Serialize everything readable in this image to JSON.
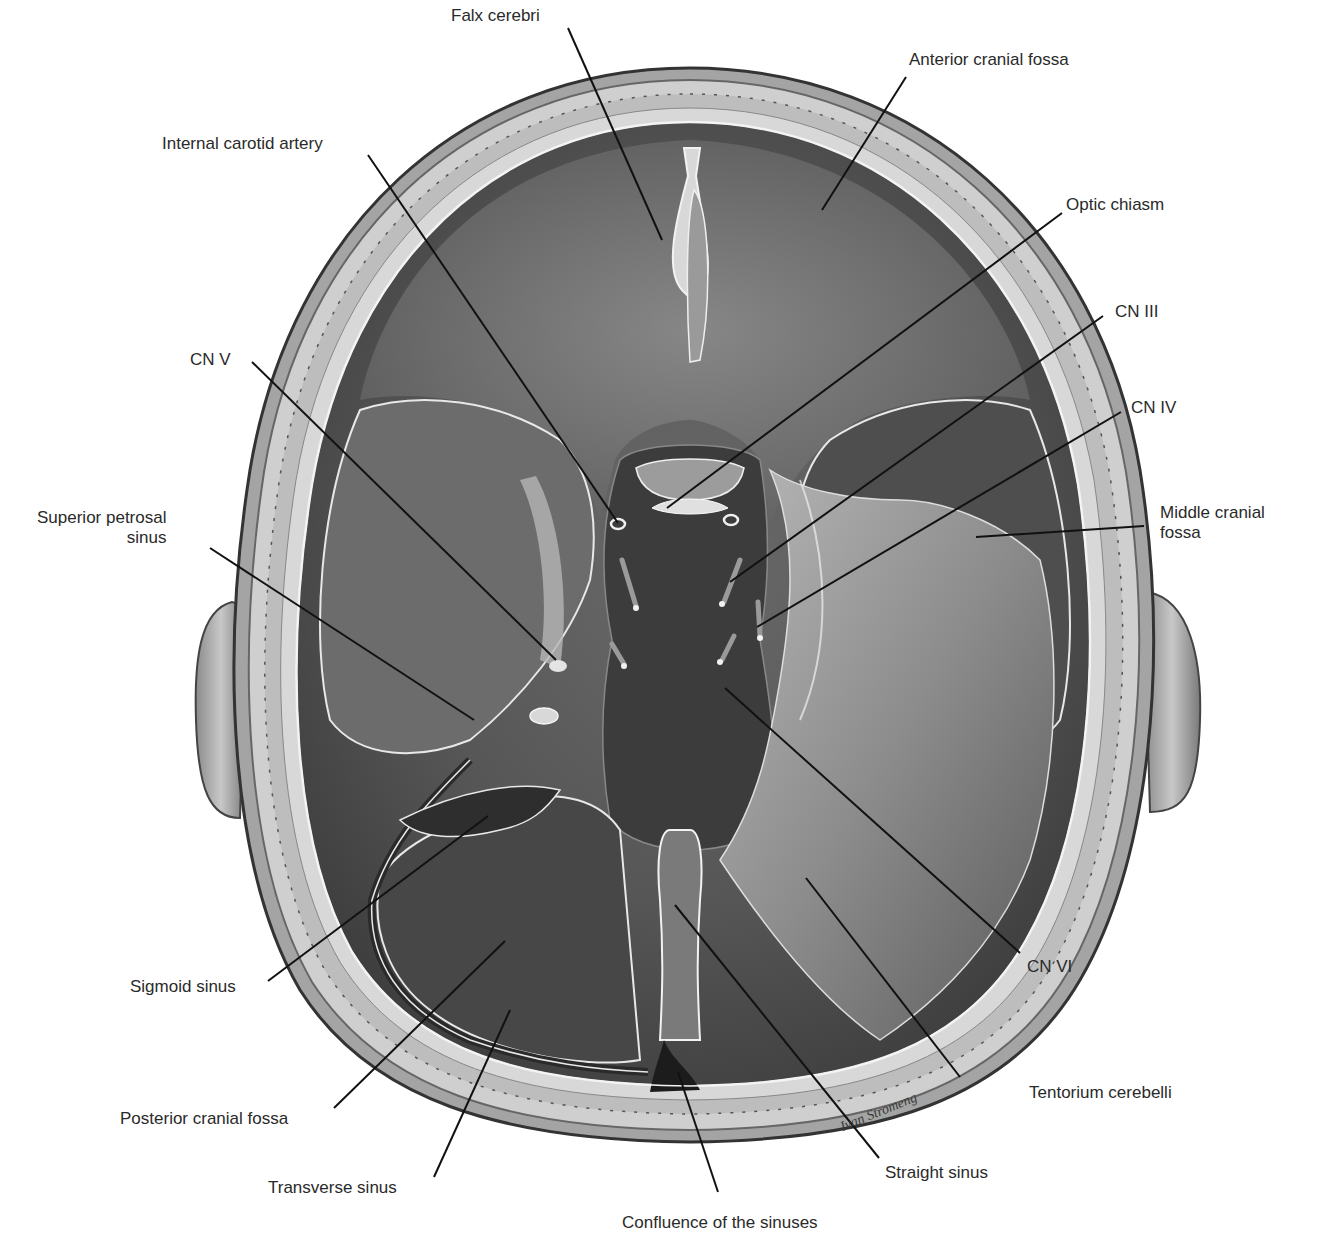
{
  "figure": {
    "signature": "Ivan Stromeng"
  },
  "labels": [
    {
      "id": "falx-cerebri",
      "lines": [
        "Falx cerebri"
      ],
      "x": 451,
      "y": 6,
      "align": "left",
      "leader": [
        [
          568,
          28
        ],
        [
          662,
          240
        ]
      ]
    },
    {
      "id": "anterior-cranial-fossa",
      "lines": [
        "Anterior cranial fossa"
      ],
      "x": 909,
      "y": 50,
      "align": "left",
      "leader": [
        [
          906,
          77
        ],
        [
          822,
          210
        ]
      ]
    },
    {
      "id": "internal-carotid-artery",
      "lines": [
        "Internal carotid artery"
      ],
      "x": 162,
      "y": 134,
      "align": "left",
      "leader": [
        [
          368,
          155
        ],
        [
          618,
          523
        ]
      ]
    },
    {
      "id": "optic-chiasm",
      "lines": [
        "Optic chiasm"
      ],
      "x": 1066,
      "y": 195,
      "align": "left",
      "leader": [
        [
          1062,
          213
        ],
        [
          667,
          508
        ]
      ]
    },
    {
      "id": "cn-iii",
      "lines": [
        "CN III"
      ],
      "x": 1115,
      "y": 302,
      "align": "left",
      "leader": [
        [
          1103,
          316
        ],
        [
          730,
          582
        ]
      ]
    },
    {
      "id": "cn-iv",
      "lines": [
        "CN IV"
      ],
      "x": 1131,
      "y": 398,
      "align": "left",
      "leader": [
        [
          1121,
          412
        ],
        [
          757,
          627
        ]
      ]
    },
    {
      "id": "cn-v",
      "lines": [
        "CN V"
      ],
      "x": 190,
      "y": 350,
      "align": "left",
      "leader": [
        [
          252,
          362
        ],
        [
          556,
          660
        ]
      ]
    },
    {
      "id": "superior-petrosal-sinus",
      "lines": [
        "Superior petrosal",
        "sinus"
      ],
      "x": 37,
      "y": 508,
      "align": "right",
      "leader": [
        [
          210,
          548
        ],
        [
          474,
          720
        ]
      ]
    },
    {
      "id": "middle-cranial-fossa",
      "lines": [
        "Middle cranial",
        "fossa"
      ],
      "x": 1160,
      "y": 503,
      "align": "left",
      "leader": [
        [
          1144,
          526
        ],
        [
          976,
          537
        ]
      ]
    },
    {
      "id": "sigmoid-sinus",
      "lines": [
        "Sigmoid sinus"
      ],
      "x": 130,
      "y": 977,
      "align": "left",
      "leader": [
        [
          268,
          981
        ],
        [
          488,
          816
        ]
      ]
    },
    {
      "id": "posterior-cranial-fossa",
      "lines": [
        "Posterior cranial fossa"
      ],
      "x": 120,
      "y": 1109,
      "align": "left",
      "leader": [
        [
          334,
          1108
        ],
        [
          505,
          941
        ]
      ]
    },
    {
      "id": "transverse-sinus",
      "lines": [
        "Transverse sinus"
      ],
      "x": 268,
      "y": 1178,
      "align": "left",
      "leader": [
        [
          434,
          1177
        ],
        [
          510,
          1010
        ]
      ]
    },
    {
      "id": "confluence-of-the-sinuses",
      "lines": [
        "Confluence of the sinuses"
      ],
      "x": 622,
      "y": 1213,
      "align": "left",
      "leader": [
        [
          718,
          1192
        ],
        [
          678,
          1072
        ]
      ]
    },
    {
      "id": "straight-sinus",
      "lines": [
        "Straight sinus"
      ],
      "x": 885,
      "y": 1163,
      "align": "left",
      "leader": [
        [
          879,
          1158
        ],
        [
          675,
          905
        ]
      ]
    },
    {
      "id": "tentorium-cerebelli",
      "lines": [
        "Tentorium cerebelli"
      ],
      "x": 1029,
      "y": 1083,
      "align": "left",
      "leader": [
        [
          960,
          1077
        ],
        [
          806,
          878
        ]
      ]
    },
    {
      "id": "cn-vi",
      "lines": [
        "CN VI"
      ],
      "x": 1027,
      "y": 957,
      "align": "left",
      "leader": [
        [
          1020,
          953
        ],
        [
          725,
          688
        ]
      ]
    }
  ],
  "colors": {
    "background": "#ffffff",
    "label_text": "#2a2a2a",
    "leader_line": "#111111",
    "bone_outer": "#9a9a9a",
    "bone_inner": "#d4d4d4",
    "dura_dark": "#4a4a4a",
    "dura_mid": "#6e6e6e",
    "dura_light": "#a8a8a8",
    "highlight": "#e8e8e8"
  }
}
